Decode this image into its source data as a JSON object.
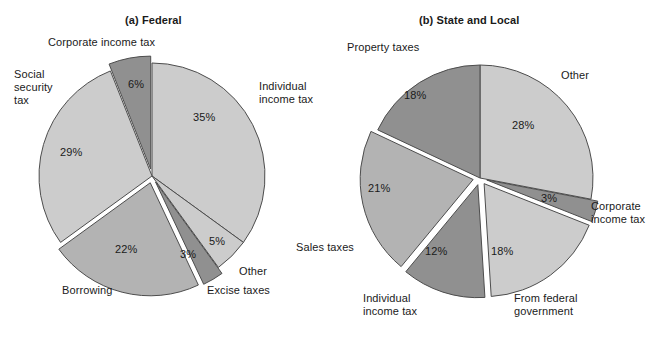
{
  "page": {
    "width": 662,
    "height": 337,
    "background": "#ffffff"
  },
  "colors": {
    "light": "#cccccc",
    "medium": "#b3b3b3",
    "dark": "#909090",
    "outline": "#4d4d4d",
    "text": "#1a1a1a",
    "gap": "#ffffff"
  },
  "charts": {
    "federal": {
      "title": "(a) Federal",
      "center": {
        "x": 152,
        "y": 176
      },
      "radius": 113
    },
    "state_local": {
      "title": "(b) State and Local",
      "center": {
        "x": 480,
        "y": 178
      },
      "radius": 113
    }
  },
  "chart_data": [
    {
      "type": "pie",
      "title": "(a) Federal",
      "unit": "percent",
      "categories": [
        "Individual income tax",
        "Other",
        "Excise taxes",
        "Borrowing",
        "Social security tax",
        "Corporate income tax"
      ],
      "values": [
        35,
        5,
        3,
        22,
        29,
        6
      ],
      "labels": [
        "35%",
        "5%",
        "3%",
        "22%",
        "29%",
        "6%"
      ],
      "shades": [
        "light",
        "light",
        "dark",
        "medium",
        "light",
        "dark"
      ],
      "exploded": [
        false,
        false,
        true,
        true,
        false,
        true
      ],
      "legend": "labels placed outside slices",
      "xlabel": "",
      "ylabel": ""
    },
    {
      "type": "pie",
      "title": "(b) State and Local",
      "unit": "percent",
      "categories": [
        "Other",
        "Corporate income tax",
        "From federal government",
        "Individual income tax",
        "Sales taxes",
        "Property taxes"
      ],
      "values": [
        28,
        3,
        18,
        12,
        21,
        18
      ],
      "labels": [
        "28%",
        "3%",
        "18%",
        "12%",
        "21%",
        "18%"
      ],
      "shades": [
        "light",
        "dark",
        "light",
        "dark",
        "medium",
        "dark"
      ],
      "exploded": [
        false,
        true,
        true,
        true,
        true,
        false
      ],
      "legend": "labels placed outside slices",
      "xlabel": "",
      "ylabel": ""
    }
  ],
  "federal_labels": {
    "corporate_income_tax": "Corporate income tax",
    "social_security_tax": "Social\nsecurity\ntax",
    "individual_income_tax": "Individual\nincome tax",
    "other": "Other",
    "excise_taxes": "Excise taxes",
    "borrowing": "Borrowing"
  },
  "federal_percents": {
    "corporate_income_tax": "6%",
    "social_security_tax": "29%",
    "individual_income_tax": "35%",
    "other": "5%",
    "excise_taxes": "3%",
    "borrowing": "22%"
  },
  "state_labels": {
    "property_taxes": "Property taxes",
    "other": "Other",
    "corporate_income_tax": "Corporate\nincome tax",
    "from_federal_government": "From federal\ngovernment",
    "individual_income_tax": "Individual\nincome tax",
    "sales_taxes": "Sales taxes"
  },
  "state_percents": {
    "property_taxes": "18%",
    "other": "28%",
    "corporate_income_tax": "3%",
    "from_federal_government": "18%",
    "individual_income_tax": "12%",
    "sales_taxes": "21%"
  }
}
